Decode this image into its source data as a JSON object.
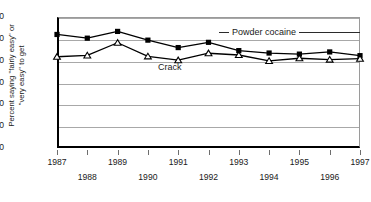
{
  "chart_data": {
    "type": "line",
    "title": "",
    "xlabel": "",
    "ylabel": "Percent saying \"fairly easy\" or \"very easy\" to get",
    "ylabel_lines": [
      "Percent saying \"fairly easy\" or",
      "\"very easy\" to get"
    ],
    "x": [
      1987,
      1988,
      1989,
      1990,
      1991,
      1992,
      1993,
      1994,
      1995,
      1996,
      1997
    ],
    "xticklabels": [
      "1987",
      "1988",
      "1989",
      "1990",
      "1991",
      "1992",
      "1993",
      "1994",
      "1995",
      "1996",
      "1997"
    ],
    "yticks": [
      0,
      10,
      20,
      30,
      40,
      50,
      60
    ],
    "yticklabels": [
      "0",
      "10",
      "20",
      "30",
      "40",
      "50",
      "60"
    ],
    "ylim": [
      0,
      60
    ],
    "xlim": [
      1987,
      1997
    ],
    "grid": "horizontal",
    "legend_position": "inline-annotations",
    "series": [
      {
        "name": "Powder cocaine",
        "marker": "square",
        "color": "#000000",
        "values": [
          52.0,
          50.3,
          53.4,
          49.4,
          46.0,
          48.4,
          44.6,
          43.5,
          43.0,
          44.0,
          42.3
        ]
      },
      {
        "name": "Crack",
        "marker": "triangle",
        "color": "#000000",
        "values": [
          41.8,
          42.4,
          48.2,
          42.0,
          40.2,
          43.4,
          42.6,
          39.9,
          41.1,
          40.5,
          40.9
        ]
      }
    ],
    "annotations": [
      {
        "text": "Powder cocaine",
        "series": "Powder cocaine"
      },
      {
        "text": "Crack",
        "series": "Crack"
      }
    ]
  },
  "axis": {
    "y_title_line1": "Percent saying \"fairly easy\" or",
    "y_title_line2": "\"very easy\" to get"
  }
}
